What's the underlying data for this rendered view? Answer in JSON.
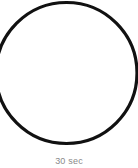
{
  "figure": {
    "caption": "30 sec",
    "background_color": "#ffffff",
    "caption_color": "#8a8a8a"
  },
  "chart_data": {
    "type": "diagram",
    "title": "",
    "subtitle": "",
    "xlabel": "",
    "ylabel": "",
    "annotations": [
      "30 sec"
    ],
    "legend": [],
    "shapes": [
      {
        "name": "circle-outline",
        "kind": "circle",
        "center_x": 66.5,
        "center_y": 73.0,
        "radius": 70.5,
        "stroke_color": "#111111",
        "stroke_width": 3.2,
        "fill": "none"
      }
    ]
  }
}
